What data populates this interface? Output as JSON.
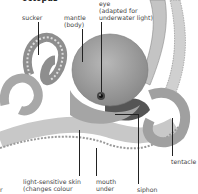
{
  "diagram": {
    "title": "octopus",
    "labels": {
      "sucker": "sucker",
      "mantle_l1": "mantle",
      "mantle_l2": "(body)",
      "eye_l1": "eye",
      "eye_l2": "(adapted for",
      "eye_l3": "underwater light)",
      "skin_l1": "light-sensitive skin",
      "skin_l2": "(changes colour",
      "mouth_l1": "mouth",
      "mouth_l2": "under",
      "siphon": "siphon",
      "tentacle": "tentacle",
      "cutoff_left": "r"
    },
    "colors": {
      "body": "#9a9a9a",
      "body_light": "#c8c8c8",
      "suckers": "#dcdcdc",
      "text": "#444444",
      "leader": "#222222"
    }
  }
}
